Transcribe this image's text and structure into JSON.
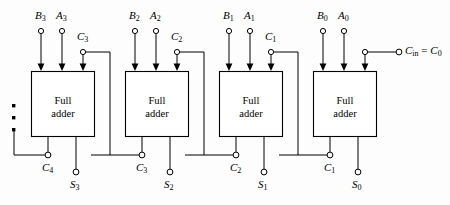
{
  "figure": {
    "background_color": "#fdfdfd",
    "line_color": "#000000",
    "text_color": "#000000"
  },
  "stages": [
    {
      "id": "stage-3",
      "box_label_line1": "Full",
      "box_label_line2": "adder",
      "inputs": [
        {
          "name": "B3",
          "text": "B",
          "sub": "3"
        },
        {
          "name": "A3",
          "text": "A",
          "sub": "3"
        },
        {
          "name": "C3",
          "text": "C",
          "sub": "3"
        }
      ],
      "outputs": [
        {
          "name": "C4",
          "text": "C",
          "sub": "4"
        },
        {
          "name": "S3",
          "text": "S",
          "sub": "3"
        }
      ]
    },
    {
      "id": "stage-2",
      "box_label_line1": "Full",
      "box_label_line2": "adder",
      "inputs": [
        {
          "name": "B2",
          "text": "B",
          "sub": "2"
        },
        {
          "name": "A2",
          "text": "A",
          "sub": "2"
        },
        {
          "name": "C2",
          "text": "C",
          "sub": "2"
        }
      ],
      "outputs": [
        {
          "name": "C3",
          "text": "C",
          "sub": "3"
        },
        {
          "name": "S2",
          "text": "S",
          "sub": "2"
        }
      ]
    },
    {
      "id": "stage-1",
      "box_label_line1": "Full",
      "box_label_line2": "adder",
      "inputs": [
        {
          "name": "B1",
          "text": "B",
          "sub": "1"
        },
        {
          "name": "A1",
          "text": "A",
          "sub": "1"
        },
        {
          "name": "C1",
          "text": "C",
          "sub": "1"
        }
      ],
      "outputs": [
        {
          "name": "C2",
          "text": "C",
          "sub": "2"
        },
        {
          "name": "S1",
          "text": "S",
          "sub": "1"
        }
      ]
    },
    {
      "id": "stage-0",
      "box_label_line1": "Full",
      "box_label_line2": "adder",
      "inputs": [
        {
          "name": "B0",
          "text": "B",
          "sub": "0"
        },
        {
          "name": "A0",
          "text": "A",
          "sub": "0"
        }
      ],
      "outputs": [
        {
          "name": "C1",
          "text": "C",
          "sub": "1"
        },
        {
          "name": "S0",
          "text": "S",
          "sub": "0"
        }
      ]
    }
  ],
  "labels": {
    "B3": "B",
    "B3_sub": "3",
    "A3": "A",
    "A3_sub": "3",
    "C3_in": "C",
    "C3_in_sub": "3",
    "B2": "B",
    "B2_sub": "2",
    "A2": "A",
    "A2_sub": "2",
    "C2_in": "C",
    "C2_in_sub": "2",
    "B1": "B",
    "B1_sub": "1",
    "A1": "A",
    "A1_sub": "1",
    "C1_in": "C",
    "C1_in_sub": "1",
    "B0": "B",
    "B0_sub": "0",
    "A0": "A",
    "A0_sub": "0",
    "C4": "C",
    "C4_sub": "4",
    "S3": "S",
    "S3_sub": "3",
    "C3_out": "C",
    "C3_out_sub": "3",
    "S2": "S",
    "S2_sub": "2",
    "C2_out": "C",
    "C2_out_sub": "2",
    "S1": "S",
    "S1_sub": "1",
    "C1_out": "C",
    "C1_out_sub": "1",
    "S0": "S",
    "S0_sub": "0",
    "cin": "C",
    "cin_sub": "in",
    "cin_eq": " = ",
    "cin_c0": "C",
    "cin_c0_sub": "0",
    "full": "Full",
    "adder": "adder"
  },
  "ellipsis": {
    "name": "continuation-dots",
    "count": 3,
    "glyph": "▪"
  }
}
